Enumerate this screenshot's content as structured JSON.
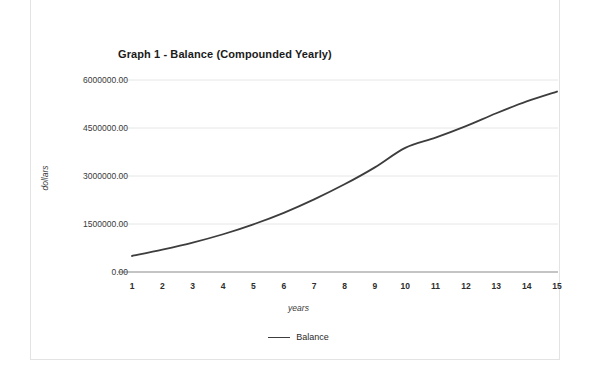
{
  "chart_data": {
    "type": "line",
    "title": "Graph 1 - Balance (Compounded Yearly)",
    "xlabel": "years",
    "ylabel": "dollars",
    "x": [
      1,
      2,
      3,
      4,
      5,
      6,
      7,
      8,
      9,
      10,
      11,
      12,
      13,
      14,
      15
    ],
    "categories": [
      "1",
      "2",
      "3",
      "4",
      "5",
      "6",
      "7",
      "8",
      "9",
      "10",
      "11",
      "12",
      "13",
      "14",
      "15"
    ],
    "series": [
      {
        "name": "Balance",
        "color": "#3d3d3d",
        "values": [
          500000.0,
          700000.0,
          920000.0,
          1180000.0,
          1490000.0,
          1850000.0,
          2270000.0,
          2740000.0,
          3270000.0,
          3880000.0,
          4200000.0,
          4560000.0,
          4960000.0,
          5330000.0,
          5640000.0
        ]
      }
    ],
    "ylim": [
      0,
      6600000
    ],
    "xlim": [
      1,
      15
    ],
    "ytick_values": [
      0,
      1500000,
      3000000,
      4500000,
      6000000
    ],
    "ytick_labels": [
      "0.00",
      "1500000.00",
      "3000000.00",
      "4500000.00",
      "6000000.00"
    ],
    "xtick_labels": [
      "1",
      "2",
      "3",
      "4",
      "5",
      "6",
      "7",
      "8",
      "9",
      "10",
      "11",
      "12",
      "13",
      "14",
      "15"
    ],
    "grid": true,
    "grid_axis": "y",
    "grid_color": "#e6e6e6",
    "legend": {
      "position": "bottom",
      "entries": [
        {
          "label": "Balance",
          "color": "#3d3d3d",
          "marker": "line"
        }
      ]
    },
    "axis_color": "#8a8a8a",
    "background": "#ffffff",
    "border_color": "#e3e3e3"
  }
}
